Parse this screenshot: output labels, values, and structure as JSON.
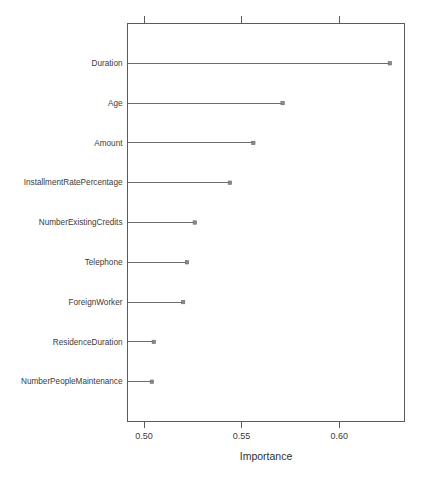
{
  "chart_data": {
    "type": "bar",
    "title": "",
    "subtitle": "",
    "xlabel": "Importance",
    "ylabel": "",
    "categories": [
      "Duration",
      "Age",
      "Amount",
      "InstallmentRatePercentage",
      "NumberExistingCredits",
      "Telephone",
      "ForeignWorker",
      "ResidenceDuration",
      "NumberPeopleMaintenance"
    ],
    "values": [
      0.626,
      0.571,
      0.556,
      0.544,
      0.526,
      0.522,
      0.52,
      0.505,
      0.504
    ],
    "xlim": [
      0.4915,
      0.6335
    ],
    "ylim": [
      0,
      10
    ],
    "xticks": [
      0.5,
      0.55,
      0.6
    ],
    "xticklabels": [
      "0.50",
      "0.55",
      "0.60"
    ],
    "yticks": [],
    "grid": false,
    "legend": null,
    "baseline": 0.4915,
    "marker": "point",
    "orientation": "horizontal",
    "style": "lollipop"
  },
  "plot": {
    "point_color": "#8a8a8a",
    "line_color": "#6b6b6b",
    "border_color": "#5a5a5a",
    "background": "#ffffff"
  }
}
